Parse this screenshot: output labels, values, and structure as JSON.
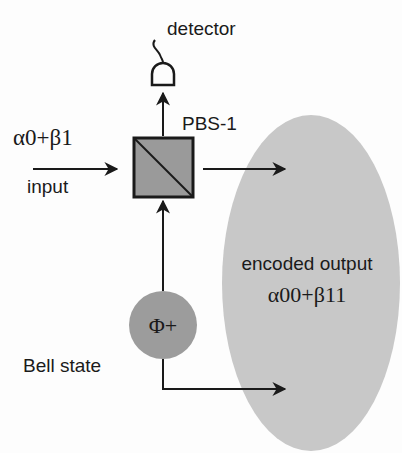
{
  "diagram": {
    "detector_label": "detector",
    "pbs_label": "PBS-1",
    "input_state": "α0+β1",
    "input_label": "input",
    "bell_state_symbol": "Φ+",
    "bell_state_label": "Bell state",
    "output_label": "encoded output",
    "output_state": "α00+β11"
  },
  "colors": {
    "line": "#1a1a1a",
    "pbs_fill": "#9a9a9a",
    "bell_fill": "#9c9c9c",
    "ellipse_fill": "#c8c8c8",
    "background": "#fdfdfd"
  }
}
